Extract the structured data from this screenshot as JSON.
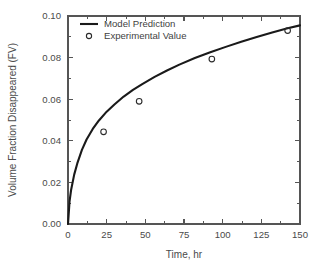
{
  "chart_data": {
    "type": "line",
    "title": "",
    "subtitle": "",
    "xlabel": "Time, hr",
    "ylabel": "Volume Fraction Disappeared (FV)",
    "xlim": [
      0,
      150
    ],
    "ylim": [
      0.0,
      0.1
    ],
    "xticks": [
      0,
      25,
      50,
      75,
      100,
      125,
      150
    ],
    "xtick_labels": [
      "0",
      "25",
      "50",
      "75",
      "100",
      "125",
      "150"
    ],
    "yticks": [
      0.0,
      0.02,
      0.04,
      0.06,
      0.08,
      0.1
    ],
    "ytick_labels": [
      "0.00",
      "0.02",
      "0.04",
      "0.06",
      "0.08",
      "0.10"
    ],
    "x_minor_ticks": [
      12.5,
      37.5,
      62.5,
      87.5,
      112.5,
      137.5
    ],
    "y_minor_ticks": [
      0.01,
      0.03,
      0.05,
      0.07,
      0.09
    ],
    "grid": false,
    "legend_position": "top-left",
    "series": [
      {
        "name": "Model Prediction",
        "kind": "line",
        "color": "#1a1a1a",
        "x": [
          0,
          1,
          2,
          4,
          6,
          9,
          12,
          16,
          20,
          25,
          30,
          36,
          42,
          48,
          56,
          64,
          72,
          82,
          92,
          102,
          112,
          122,
          132,
          142,
          150
        ],
        "y": [
          0.0,
          0.0085,
          0.0128,
          0.0186,
          0.0228,
          0.0279,
          0.0318,
          0.0358,
          0.039,
          0.0423,
          0.045,
          0.048,
          0.0505,
          0.0527,
          0.0554,
          0.0578,
          0.06,
          0.0625,
          0.0647,
          0.0667,
          0.0686,
          0.0704,
          0.0721,
          0.0737,
          0.0748
        ]
      },
      {
        "name": "Experimental Value",
        "kind": "scatter",
        "marker": "open-circle",
        "color": "#2b2b2b",
        "x": [
          23,
          46,
          93,
          142
        ],
        "y": [
          0.0443,
          0.059,
          0.0793,
          0.093
        ]
      }
    ]
  },
  "legend": {
    "entries": [
      {
        "label": "Model Prediction",
        "symbol": "line"
      },
      {
        "label": "Experimental Value",
        "symbol": "open-circle"
      }
    ]
  },
  "axes": {
    "x_title": "Time, hr",
    "y_title": "Volume Fraction Disappeared (FV)"
  }
}
